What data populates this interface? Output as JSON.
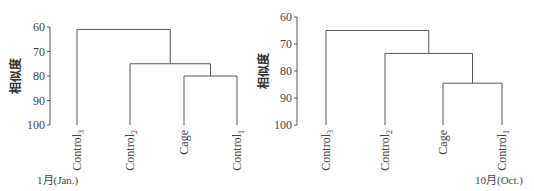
{
  "chart_data": [
    {
      "type": "dendrogram",
      "title": "",
      "caption": "1月(Jan.)",
      "ylabel": "相似度",
      "ylim": [
        60,
        100
      ],
      "yticks": [
        60,
        70,
        80,
        90,
        100
      ],
      "leaves": [
        "Control3",
        "Control2",
        "Cage",
        "Control1"
      ],
      "leaf_labels": [
        {
          "base": "Control",
          "sub": "3"
        },
        {
          "base": "Control",
          "sub": "2"
        },
        {
          "base": "Cage",
          "sub": ""
        },
        {
          "base": "Control",
          "sub": "1"
        }
      ],
      "merges": [
        {
          "members": [
            "Cage",
            "Control1"
          ],
          "similarity": 80
        },
        {
          "members": [
            "Control2",
            "Cage+Control1"
          ],
          "similarity": 75
        },
        {
          "members": [
            "Control3",
            "Control2+Cage+Control1"
          ],
          "similarity": 61
        }
      ]
    },
    {
      "type": "dendrogram",
      "title": "",
      "caption": "10月(Oct.)",
      "ylabel": "相似度",
      "ylim": [
        60,
        100
      ],
      "yticks": [
        60,
        70,
        80,
        90,
        100
      ],
      "leaves": [
        "Control3",
        "Control2",
        "Cage",
        "Control1"
      ],
      "leaf_labels": [
        {
          "base": "Control",
          "sub": "3"
        },
        {
          "base": "Control",
          "sub": "2"
        },
        {
          "base": "Cage",
          "sub": ""
        },
        {
          "base": "Control",
          "sub": "1"
        }
      ],
      "merges": [
        {
          "members": [
            "Cage",
            "Control1"
          ],
          "similarity": 84.5
        },
        {
          "members": [
            "Control2",
            "Cage+Control1"
          ],
          "similarity": 73.5
        },
        {
          "members": [
            "Control3",
            "Control2+Cage+Control1"
          ],
          "similarity": 65
        }
      ]
    }
  ]
}
